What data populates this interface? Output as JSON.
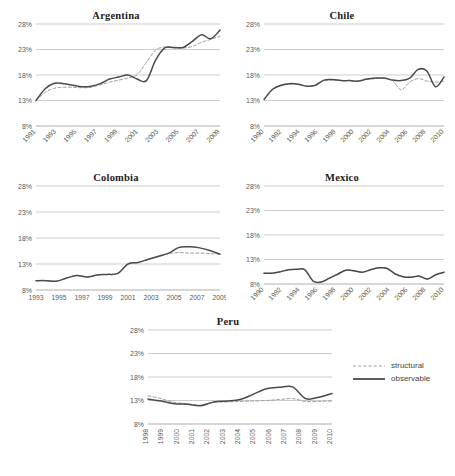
{
  "figure": {
    "background": "#ffffff",
    "observable_color": "#4a4a4a",
    "structural_color": "#9b9b9b",
    "gridline_color": "#b7b7b7"
  },
  "legend": {
    "position": "bottom-right",
    "entries": [
      {
        "label": "structural",
        "style": "dashed",
        "color": "#9b9b9b",
        "name": "legend-structural"
      },
      {
        "label": "observable",
        "style": "solid",
        "color": "#4a4a4a",
        "name": "legend-observable"
      }
    ]
  },
  "chart_data": [
    {
      "type": "line",
      "title": "Argentina",
      "xlabel": "",
      "ylabel": "",
      "ylim": [
        8,
        28
      ],
      "yticks": [
        8,
        13,
        18,
        23,
        28
      ],
      "ytick_labels": [
        "8%",
        "13%",
        "18%",
        "23%",
        "28%"
      ],
      "grid": true,
      "xtick_orientation": "rotated",
      "xtick_labels": [
        "1991",
        "1993",
        "1995",
        "1997",
        "1999",
        "2001",
        "2003",
        "2005",
        "2007",
        "2009"
      ],
      "x": [
        1991,
        1992,
        1993,
        1994,
        1995,
        1996,
        1997,
        1998,
        1999,
        2000,
        2001,
        2002,
        2003,
        2004,
        2005,
        2006,
        2007,
        2008,
        2009,
        2010
      ],
      "series": [
        {
          "name": "observable",
          "values": [
            13.0,
            15.3,
            16.4,
            16.3,
            16.0,
            15.7,
            15.8,
            16.3,
            17.2,
            17.6,
            18.0,
            17.2,
            16.9,
            20.9,
            23.3,
            23.4,
            23.4,
            24.6,
            25.9,
            25.1,
            26.8
          ]
        },
        {
          "name": "structural",
          "values": [
            13.0,
            14.6,
            15.4,
            15.6,
            15.6,
            15.5,
            15.6,
            16.1,
            16.6,
            17.0,
            17.4,
            18.1,
            20.5,
            22.9,
            23.5,
            23.3,
            23.3,
            23.6,
            24.4,
            25.0,
            25.6
          ]
        }
      ]
    },
    {
      "type": "line",
      "title": "Chile",
      "xlabel": "",
      "ylabel": "",
      "ylim": [
        8,
        28
      ],
      "yticks": [
        8,
        13,
        18,
        23,
        28
      ],
      "ytick_labels": [
        "8%",
        "13%",
        "18%",
        "23%",
        "28%"
      ],
      "grid": true,
      "xtick_orientation": "rotated",
      "xtick_labels": [
        "1990",
        "1992",
        "1994",
        "1996",
        "1998",
        "2000",
        "2002",
        "2004",
        "2006",
        "2008",
        "2010"
      ],
      "x": [
        1990,
        1991,
        1992,
        1993,
        1994,
        1995,
        1996,
        1997,
        1998,
        1999,
        2000,
        2001,
        2002,
        2003,
        2004,
        2005,
        2006,
        2007,
        2008,
        2009,
        2010
      ],
      "series": [
        {
          "name": "observable",
          "values": [
            13.2,
            15.2,
            16.0,
            16.3,
            16.2,
            15.8,
            16.0,
            17.0,
            17.1,
            16.9,
            16.9,
            16.8,
            17.2,
            17.4,
            17.4,
            17.0,
            16.9,
            17.4,
            19.1,
            18.8,
            15.7,
            17.6
          ]
        },
        {
          "name": "structural",
          "values": [
            13.2,
            15.1,
            15.9,
            16.2,
            16.1,
            15.8,
            16.0,
            16.9,
            17.0,
            16.9,
            16.9,
            16.8,
            17.1,
            17.3,
            17.3,
            16.9,
            15.1,
            16.6,
            17.3,
            16.8,
            16.6,
            16.8
          ]
        }
      ]
    },
    {
      "type": "line",
      "title": "Colombia",
      "xlabel": "",
      "ylabel": "",
      "ylim": [
        8,
        28
      ],
      "yticks": [
        8,
        13,
        18,
        23,
        28
      ],
      "ytick_labels": [
        "8%",
        "13%",
        "18%",
        "23%",
        "28%"
      ],
      "grid": true,
      "xtick_orientation": "horizontal",
      "xtick_labels": [
        "1993",
        "1995",
        "1997",
        "1999",
        "2001",
        "2003",
        "2005",
        "2007",
        "2009"
      ],
      "x": [
        1993,
        1994,
        1995,
        1996,
        1997,
        1998,
        1999,
        2000,
        2001,
        2002,
        2003,
        2004,
        2005,
        2006,
        2007,
        2008,
        2009,
        2010
      ],
      "series": [
        {
          "name": "observable",
          "values": [
            9.8,
            9.8,
            9.7,
            10.3,
            10.8,
            10.5,
            10.9,
            11.0,
            11.2,
            13.0,
            13.3,
            13.9,
            14.5,
            15.1,
            16.2,
            16.3,
            16.1,
            15.6,
            14.9
          ]
        },
        {
          "name": "structural",
          "values": [
            9.8,
            9.8,
            9.7,
            10.3,
            10.8,
            10.5,
            10.9,
            11.0,
            11.2,
            13.0,
            13.3,
            13.9,
            14.4,
            15.0,
            15.2,
            15.1,
            15.1,
            15.0,
            14.9
          ]
        }
      ]
    },
    {
      "type": "line",
      "title": "Mexico",
      "xlabel": "",
      "ylabel": "",
      "ylim": [
        8,
        28
      ],
      "yticks": [
        8,
        13,
        18,
        23,
        28
      ],
      "ytick_labels": [
        "8%",
        "13%",
        "18%",
        "23%",
        "28%"
      ],
      "grid": true,
      "xtick_orientation": "rotated",
      "xtick_labels": [
        "1990",
        "1992",
        "1994",
        "1996",
        "1998",
        "2000",
        "2002",
        "2004",
        "2006",
        "2008",
        "2010"
      ],
      "x": [
        1990,
        1991,
        1992,
        1993,
        1994,
        1995,
        1996,
        1997,
        1998,
        1999,
        2000,
        2001,
        2002,
        2003,
        2004,
        2005,
        2006,
        2007,
        2008,
        2009,
        2010
      ],
      "series": [
        {
          "name": "observable",
          "values": [
            10.2,
            10.2,
            10.5,
            10.9,
            11.0,
            10.9,
            8.6,
            8.4,
            9.2,
            10.0,
            10.8,
            10.7,
            10.4,
            10.9,
            11.3,
            11.2,
            10.1,
            9.5,
            9.4,
            9.6,
            9.0,
            9.9,
            10.4
          ]
        },
        {
          "name": "structural",
          "values": [
            10.2,
            10.2,
            10.5,
            10.9,
            11.0,
            10.9,
            8.6,
            8.4,
            9.2,
            10.0,
            10.8,
            10.7,
            10.4,
            10.9,
            11.3,
            11.2,
            10.1,
            9.5,
            9.4,
            9.6,
            9.0,
            9.9,
            10.4
          ]
        }
      ]
    },
    {
      "type": "line",
      "title": "Peru",
      "xlabel": "",
      "ylabel": "",
      "ylim": [
        8,
        28
      ],
      "yticks": [
        8,
        13,
        18,
        23,
        28
      ],
      "ytick_labels": [
        "8%",
        "13%",
        "18%",
        "23%",
        "28%"
      ],
      "grid": true,
      "xtick_orientation": "vertical",
      "xtick_labels": [
        "1998",
        "1999",
        "2000",
        "2001",
        "2002",
        "2003",
        "2004",
        "2005",
        "2006",
        "2007",
        "2008",
        "2009",
        "2010"
      ],
      "x": [
        1998,
        1999,
        2000,
        2001,
        2002,
        2003,
        2004,
        2005,
        2006,
        2007,
        2008,
        2009,
        2010
      ],
      "series": [
        {
          "name": "observable",
          "values": [
            13.3,
            12.9,
            12.3,
            12.2,
            11.9,
            12.7,
            12.9,
            13.2,
            14.3,
            15.5,
            15.8,
            15.9,
            13.4,
            13.7,
            14.5
          ]
        },
        {
          "name": "structural",
          "values": [
            14.0,
            13.4,
            12.6,
            12.3,
            12.0,
            12.6,
            12.7,
            12.8,
            12.9,
            13.0,
            13.2,
            13.4,
            12.8,
            12.8,
            12.9
          ]
        }
      ]
    }
  ]
}
